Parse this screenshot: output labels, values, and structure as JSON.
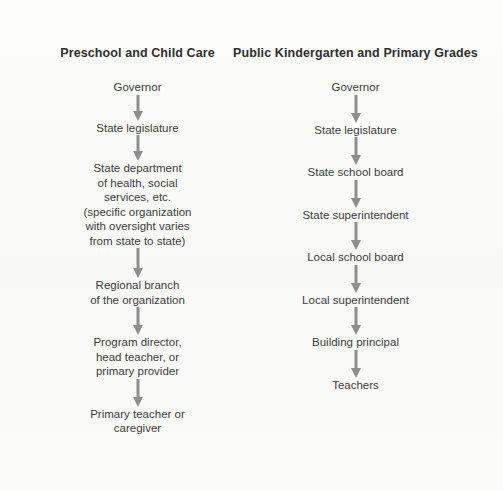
{
  "diagram": {
    "title_left": "Preschool and Child Care",
    "title_right": "Public Kindergarten and Primary Grades",
    "arrow_color": "#8e8e8e",
    "text_color": "#3d3d3d",
    "background_color": "#fbfbfa",
    "columns": [
      {
        "header": "Preschool and Child Care",
        "nodes": [
          "Governor",
          "State legislature",
          "State department\nof health, social\nservices, etc.\n(specific organization\nwith oversight varies\nfrom state to state)",
          "Regional branch\nof the organization",
          "Program director,\nhead teacher, or\nprimary provider",
          "Primary teacher or\ncaregiver"
        ],
        "arrow_gaps": [
          26,
          26,
          30,
          28,
          28
        ]
      },
      {
        "header": "Public Kindergarten and Primary Grades",
        "nodes": [
          "Governor",
          "State legislature",
          "State school board",
          "State superintendent",
          "Local school board",
          "Local superintendent",
          "Building principal",
          "Teachers"
        ],
        "arrow_gaps": [
          28,
          28,
          28,
          28,
          28,
          28,
          28
        ]
      }
    ]
  }
}
